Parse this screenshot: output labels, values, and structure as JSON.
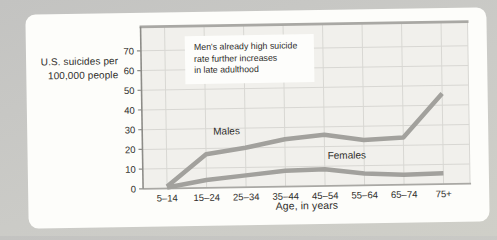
{
  "figure": {
    "y_axis_title_lines": [
      "U.S. suicides per",
      "100,000 people"
    ],
    "x_axis_title": "Age, in years",
    "annotation_lines": [
      "Men's already high suicide",
      "rate further increases",
      "in late adulthood"
    ]
  },
  "chart_data": {
    "type": "line",
    "title": "",
    "categories": [
      "5–14",
      "15–24",
      "25–34",
      "35–44",
      "45–54",
      "55–64",
      "65–74",
      "75+"
    ],
    "series": [
      {
        "name": "Males",
        "values": [
          1,
          17,
          20,
          24,
          26,
          23,
          24,
          46
        ]
      },
      {
        "name": "Females",
        "values": [
          0.5,
          4,
          6,
          8,
          8.5,
          6,
          5,
          5.5
        ]
      }
    ],
    "xlabel": "Age, in years",
    "ylabel": "U.S. suicides per 100,000 people",
    "ylim": [
      0,
      70
    ],
    "yticks": [
      0,
      10,
      20,
      30,
      40,
      50,
      60,
      70
    ],
    "grid": true,
    "legend_position": "inline-labels",
    "annotation": "Men's already high suicide rate further increases in late adulthood",
    "line_color": "#a2a19d"
  },
  "colors": {
    "page_background": "#c9c9c5",
    "card_background": "#fdfdfa",
    "plot_background": "#f1f0ec",
    "gridline": "#d8d7d3",
    "axis_frame": "#a9a8a4",
    "axis_dark": "#8d8c88",
    "text": "#2f2e2b"
  }
}
